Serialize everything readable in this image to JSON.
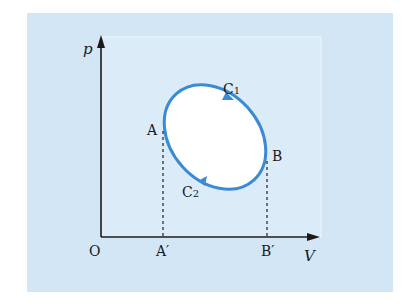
{
  "diagram": {
    "type": "p-V diagram (thermodynamic cycle)",
    "axes": {
      "y_label": "p",
      "x_label": "V",
      "origin_label": "O"
    },
    "points": {
      "A": "A",
      "B": "B",
      "A_prime": "A′",
      "B_prime": "B′"
    },
    "paths": {
      "upper": "C",
      "upper_sub": "1",
      "lower": "C",
      "lower_sub": "2"
    },
    "colors": {
      "background": "#d3e6f5",
      "curve": "#3a8ad6",
      "inner": "#ffffff",
      "axis": "#1a1a1a"
    }
  }
}
